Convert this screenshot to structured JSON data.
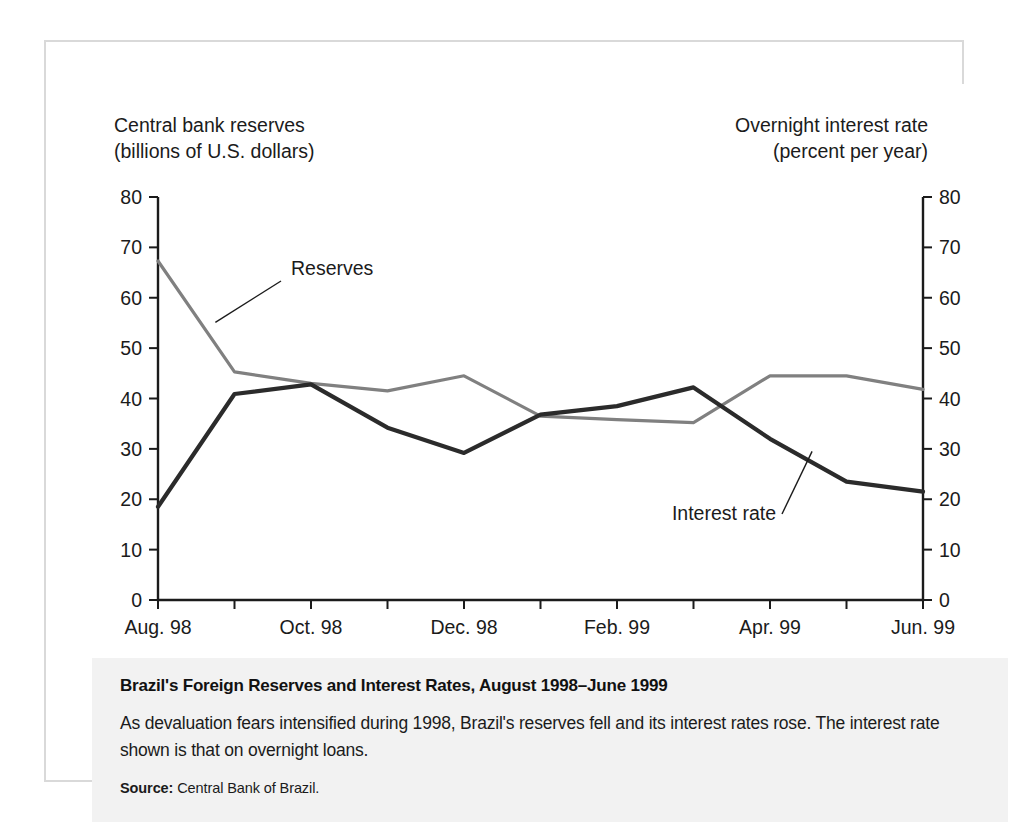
{
  "figure": {
    "left_axis_title": "Central bank reserves\n(billions of U.S. dollars)",
    "right_axis_title": "Overnight interest rate\n(percent per year)",
    "caption_title": "Brazil's Foreign Reserves and Interest Rates, August 1998–June 1999",
    "caption_body": "As devaluation fears intensified during 1998, Brazil's reserves fell and its interest rates rose. The interest rate shown is that on overnight loans.",
    "source_label": "Source:",
    "source_text": "Central Bank of Brazil."
  },
  "colors": {
    "reserves_line": "#808080",
    "interest_line": "#2b2b2b",
    "axis": "#1b1b1b",
    "frame": "#d9d9d9",
    "caption_background": "#f2f2f2",
    "chart_background": "#ffffff"
  },
  "chart_data": {
    "type": "line",
    "title": "Brazil's Foreign Reserves and Interest Rates, August 1998–June 1999",
    "xlabel": "",
    "ylabel": "Central bank reserves (billions of U.S. dollars)",
    "y2label": "Overnight interest rate (percent per year)",
    "ylim": [
      0,
      80
    ],
    "y2lim": [
      0,
      80
    ],
    "yticks": [
      0,
      10,
      20,
      30,
      40,
      50,
      60,
      70,
      80
    ],
    "y2ticks": [
      0,
      10,
      20,
      30,
      40,
      50,
      60,
      70,
      80
    ],
    "grid": false,
    "legend": "inline-annotations",
    "x": [
      "Aug. 98",
      "Sep. 98",
      "Oct. 98",
      "Nov. 98",
      "Dec. 98",
      "Jan. 99",
      "Feb. 99",
      "Mar. 99",
      "Apr. 99",
      "May 99",
      "Jun. 99"
    ],
    "xtick_labels": [
      "Aug. 98",
      "Oct. 98",
      "Dec. 98",
      "Feb. 99",
      "Apr. 99",
      "Jun. 99"
    ],
    "xtick_indices": [
      0,
      2,
      4,
      6,
      8,
      10
    ],
    "series": [
      {
        "name": "Reserves",
        "axis": "left",
        "color": "#808080",
        "values": [
          67.3,
          45.3,
          43.0,
          41.5,
          44.5,
          36.5,
          35.8,
          35.2,
          44.5,
          44.5,
          41.8
        ]
      },
      {
        "name": "Interest rate",
        "axis": "right",
        "color": "#2b2b2b",
        "values": [
          18.5,
          40.9,
          42.8,
          34.2,
          29.2,
          36.8,
          38.5,
          42.2,
          32.0,
          23.5,
          21.5
        ]
      }
    ],
    "annotations": [
      {
        "text": "Reserves",
        "series": "Reserves"
      },
      {
        "text": "Interest rate",
        "series": "Interest rate"
      }
    ]
  }
}
